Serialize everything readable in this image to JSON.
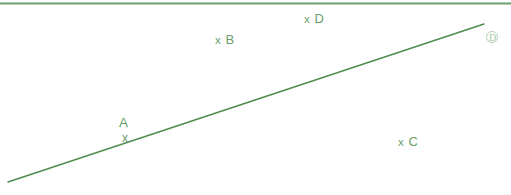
{
  "figure": {
    "background_color": "#ffffff",
    "line_color": "#4e8b4e",
    "label_color": "#6a9d6a",
    "top_rule_color": "#6ba06b",
    "marker_color": "#b6cfb6",
    "line": {
      "name": "diagonal-line",
      "x1": 8,
      "y1": 182,
      "x2": 484,
      "y2": 24,
      "stroke_width": 1.4
    },
    "top_rule": {
      "x1": 0,
      "y1": 3.5,
      "x2": 511,
      "y2": 3.5,
      "stroke_width": 2
    },
    "points": [
      {
        "id": "A",
        "name": "A",
        "mark": "x",
        "x": 126,
        "y": 136,
        "on_line": true
      },
      {
        "id": "B",
        "name": "B",
        "mark": "x",
        "x": 218,
        "y": 40,
        "on_line": false
      },
      {
        "id": "C",
        "name": "C",
        "mark": "x",
        "x": 401,
        "y": 142,
        "on_line": false
      },
      {
        "id": "D",
        "name": "D",
        "mark": "x",
        "x": 307,
        "y": 19,
        "on_line": false
      }
    ],
    "end_marker": {
      "glyph": "D",
      "x": 492,
      "y": 37
    }
  }
}
